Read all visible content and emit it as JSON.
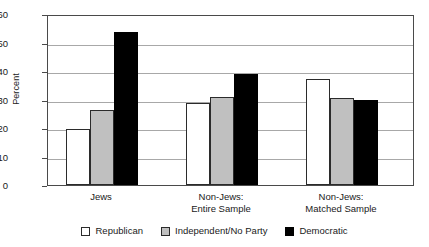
{
  "chart_data": {
    "type": "bar",
    "title": "",
    "xlabel": "",
    "ylabel": "Percent",
    "ylim": [
      0,
      60
    ],
    "yticks": [
      0,
      10,
      20,
      30,
      40,
      50,
      60
    ],
    "grid": true,
    "legend_position": "bottom",
    "categories": [
      "Jews",
      "Non-Jews:\nEntire Sample",
      "Non-Jews:\nMatched Sample"
    ],
    "category_lines": [
      [
        "Jews"
      ],
      [
        "Non-Jews:",
        "Entire Sample"
      ],
      [
        "Non-Jews:",
        "Matched Sample"
      ]
    ],
    "series": [
      {
        "name": "Republican",
        "color": "#ffffff",
        "values": [
          19.7,
          28.8,
          37.2
        ]
      },
      {
        "name": "Independent/No Party",
        "color": "#c0c0c0",
        "values": [
          26.2,
          30.9,
          30.5
        ]
      },
      {
        "name": "Democratic",
        "color": "#000000",
        "values": [
          53.7,
          38.9,
          29.8
        ]
      }
    ]
  },
  "legend": {
    "items": [
      {
        "label": "Republican",
        "swatch": "republican-swatch"
      },
      {
        "label": "Independent/No Party",
        "swatch": "independent-swatch"
      },
      {
        "label": "Democratic",
        "swatch": "democratic-swatch"
      }
    ]
  },
  "axis": {
    "y_title": "Percent",
    "y_tick_labels": [
      "60",
      "50",
      "40",
      "30",
      "20",
      "10",
      "0"
    ]
  }
}
